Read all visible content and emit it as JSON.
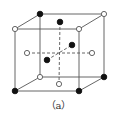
{
  "caption": "（a）",
  "colors": {
    "line": "#555555",
    "filled_atom": "#111111",
    "open_atom_fill": "#ffffff",
    "open_atom_stroke": "#555555"
  },
  "cube": {
    "front_face": {
      "x1": 15,
      "y1": 29,
      "x2": 79,
      "y2": 91
    },
    "back_face": {
      "x1": 40,
      "y1": 14,
      "x2": 104,
      "y2": 77
    }
  },
  "atoms": [
    {
      "id": "top-back-left",
      "x": 40,
      "y": 14,
      "type": "filled"
    },
    {
      "id": "top-back-right",
      "x": 104,
      "y": 14,
      "type": "open"
    },
    {
      "id": "top-front-left",
      "x": 15,
      "y": 29,
      "type": "open"
    },
    {
      "id": "top-front-right",
      "x": 79,
      "y": 29,
      "type": "open"
    },
    {
      "id": "bottom-back-left",
      "x": 40,
      "y": 77,
      "type": "open"
    },
    {
      "id": "bottom-back-right",
      "x": 104,
      "y": 77,
      "type": "filled"
    },
    {
      "id": "bottom-front-left",
      "x": 15,
      "y": 91,
      "type": "filled"
    },
    {
      "id": "bottom-front-right",
      "x": 79,
      "y": 91,
      "type": "filled"
    },
    {
      "id": "top-face-center",
      "x": 60,
      "y": 22,
      "type": "filled"
    },
    {
      "id": "bottom-face-center",
      "x": 59,
      "y": 84,
      "type": "open"
    },
    {
      "id": "left-face-center",
      "x": 27,
      "y": 53,
      "type": "open"
    },
    {
      "id": "right-face-center",
      "x": 92,
      "y": 53,
      "type": "open"
    },
    {
      "id": "back-face-center",
      "x": 72,
      "y": 45,
      "type": "filled"
    },
    {
      "id": "front-face-center",
      "x": 47,
      "y": 60,
      "type": "filled"
    }
  ],
  "dashed_lines": [
    {
      "id": "vertical-axis",
      "x1": 60,
      "y1": 22,
      "x2": 59,
      "y2": 84
    },
    {
      "id": "horizontal-axis",
      "x1": 27,
      "y1": 53,
      "x2": 92,
      "y2": 53
    },
    {
      "id": "depth-axis",
      "x1": 47,
      "y1": 60,
      "x2": 72,
      "y2": 45
    }
  ]
}
